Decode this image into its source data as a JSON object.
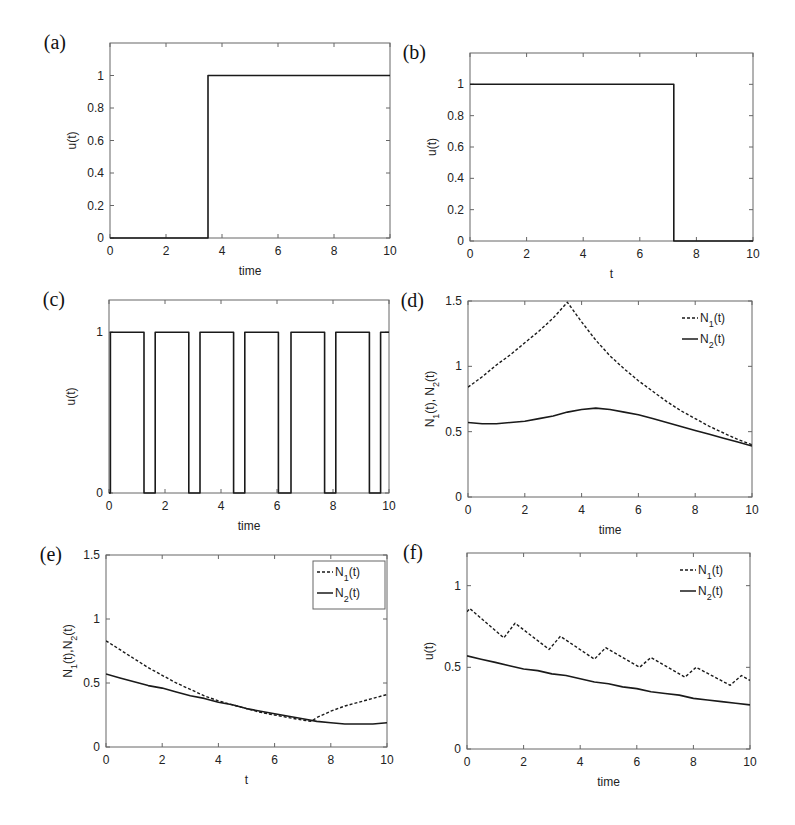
{
  "figure": {
    "caption_fragment": ""
  },
  "chart_data": [
    {
      "id": "a",
      "panel_label": "(a)",
      "type": "line",
      "xlabel": "time",
      "ylabel": "u(t)",
      "xlim": [
        0,
        10
      ],
      "ylim": [
        0,
        1.2
      ],
      "xticks": [
        0,
        2,
        4,
        6,
        8,
        10
      ],
      "yticks": [
        0,
        0.2,
        0.4,
        0.6,
        0.8,
        1
      ],
      "box": {
        "left": 110,
        "top": 43,
        "right": 390,
        "bottom": 238
      },
      "series": [
        {
          "name": "u(t)",
          "style": "solid",
          "x": [
            0,
            3.5,
            3.5,
            10
          ],
          "y": [
            0,
            0,
            1,
            1
          ]
        }
      ]
    },
    {
      "id": "b",
      "panel_label": "(b)",
      "type": "line",
      "xlabel": "t",
      "ylabel": "u(t)",
      "xlim": [
        0,
        10
      ],
      "ylim": [
        0,
        1.2
      ],
      "xticks": [
        0,
        2,
        4,
        6,
        8,
        10
      ],
      "yticks": [
        0,
        0.2,
        0.4,
        0.6,
        0.8,
        1
      ],
      "box": {
        "left": 470,
        "top": 53,
        "right": 753,
        "bottom": 241
      },
      "series": [
        {
          "name": "u(t)",
          "style": "solid",
          "x": [
            0,
            7.2,
            7.2,
            10
          ],
          "y": [
            1,
            1,
            0,
            0
          ]
        }
      ]
    },
    {
      "id": "c",
      "panel_label": "(c)",
      "type": "line",
      "xlabel": "time",
      "ylabel": "u(t)",
      "xlim": [
        0,
        10
      ],
      "ylim": [
        0,
        1.2
      ],
      "xticks": [
        0,
        2,
        4,
        6,
        8,
        10
      ],
      "yticks": [
        0,
        1
      ],
      "box": {
        "left": 109,
        "top": 300,
        "right": 389,
        "bottom": 493
      },
      "series": [
        {
          "name": "u(t)",
          "style": "solid",
          "x": [
            0,
            0.05,
            0.05,
            1.25,
            1.25,
            1.65,
            1.65,
            2.85,
            2.85,
            3.25,
            3.25,
            4.45,
            4.45,
            4.85,
            4.85,
            6.05,
            6.05,
            6.5,
            6.5,
            7.7,
            7.7,
            8.1,
            8.1,
            9.3,
            9.3,
            9.7,
            9.7,
            10
          ],
          "y": [
            0,
            0,
            1,
            1,
            0,
            0,
            1,
            1,
            0,
            0,
            1,
            1,
            0,
            0,
            1,
            1,
            0,
            0,
            1,
            1,
            0,
            0,
            1,
            1,
            0,
            0,
            1,
            1
          ]
        }
      ]
    },
    {
      "id": "d",
      "panel_label": "(d)",
      "type": "line",
      "xlabel": "time",
      "ylabel": "N1(t), N2(t)",
      "xlim": [
        0,
        10
      ],
      "ylim": [
        0,
        1.5
      ],
      "xticks": [
        0,
        2,
        4,
        6,
        8,
        10
      ],
      "yticks": [
        0,
        0.5,
        1,
        1.5
      ],
      "box": {
        "left": 468,
        "top": 301,
        "right": 752,
        "bottom": 497
      },
      "legend": {
        "position": "upper right",
        "framed": false,
        "entries": [
          "N1(t)",
          "N2(t)"
        ]
      },
      "series": [
        {
          "name": "N1(t)",
          "style": "dashed",
          "x": [
            0,
            0.5,
            1,
            1.5,
            2,
            2.5,
            3,
            3.5,
            4,
            4.5,
            5,
            5.5,
            6,
            6.5,
            7,
            7.5,
            8,
            8.5,
            9,
            9.5,
            10
          ],
          "y": [
            0.84,
            0.92,
            1.01,
            1.09,
            1.18,
            1.27,
            1.37,
            1.49,
            1.34,
            1.2,
            1.08,
            0.98,
            0.89,
            0.81,
            0.73,
            0.66,
            0.6,
            0.54,
            0.49,
            0.44,
            0.4
          ]
        },
        {
          "name": "N2(t)",
          "style": "solid",
          "x": [
            0,
            0.5,
            1,
            1.5,
            2,
            2.5,
            3,
            3.5,
            4,
            4.5,
            5,
            5.5,
            6,
            6.5,
            7,
            7.5,
            8,
            8.5,
            9,
            9.5,
            10
          ],
          "y": [
            0.57,
            0.56,
            0.56,
            0.57,
            0.58,
            0.6,
            0.62,
            0.65,
            0.67,
            0.68,
            0.67,
            0.65,
            0.63,
            0.6,
            0.57,
            0.54,
            0.51,
            0.48,
            0.45,
            0.42,
            0.39
          ]
        }
      ]
    },
    {
      "id": "e",
      "panel_label": "(e)",
      "type": "line",
      "xlabel": "t",
      "ylabel": "N1(t),N2(t)",
      "xlim": [
        0,
        10
      ],
      "ylim": [
        0,
        1.5
      ],
      "xticks": [
        0,
        2,
        4,
        6,
        8,
        10
      ],
      "yticks": [
        0,
        0.5,
        1,
        1.5
      ],
      "box": {
        "left": 106,
        "top": 555,
        "right": 387,
        "bottom": 747
      },
      "legend": {
        "position": "upper right",
        "framed": true,
        "entries": [
          "N1(t)",
          "N2(t)"
        ]
      },
      "series": [
        {
          "name": "N1(t)",
          "style": "dashed",
          "x": [
            0,
            0.5,
            1,
            1.5,
            2,
            2.5,
            3,
            3.5,
            4,
            4.5,
            5,
            5.5,
            6,
            6.5,
            7,
            7.3,
            7.5,
            8,
            8.5,
            9,
            9.5,
            10
          ],
          "y": [
            0.83,
            0.76,
            0.69,
            0.62,
            0.56,
            0.5,
            0.45,
            0.4,
            0.36,
            0.33,
            0.3,
            0.27,
            0.25,
            0.23,
            0.21,
            0.2,
            0.23,
            0.28,
            0.32,
            0.35,
            0.38,
            0.41
          ]
        },
        {
          "name": "N2(t)",
          "style": "solid",
          "x": [
            0,
            0.5,
            1,
            1.5,
            2,
            2.5,
            3,
            3.5,
            4,
            4.5,
            5,
            5.5,
            6,
            6.5,
            7,
            7.5,
            8,
            8.5,
            9,
            9.5,
            10
          ],
          "y": [
            0.57,
            0.54,
            0.51,
            0.48,
            0.46,
            0.43,
            0.4,
            0.38,
            0.35,
            0.33,
            0.3,
            0.28,
            0.26,
            0.24,
            0.22,
            0.2,
            0.19,
            0.18,
            0.18,
            0.18,
            0.19
          ]
        }
      ]
    },
    {
      "id": "f",
      "panel_label": "(f)",
      "type": "line",
      "xlabel": "time",
      "ylabel": "u(t)",
      "xlim": [
        0,
        10
      ],
      "ylim": [
        0,
        1.2
      ],
      "xticks": [
        0,
        2,
        4,
        6,
        8,
        10
      ],
      "yticks": [
        0,
        0.5,
        1
      ],
      "box": {
        "left": 467,
        "top": 553,
        "right": 750,
        "bottom": 749
      },
      "legend": {
        "position": "upper right",
        "framed": false,
        "entries": [
          "N1(t)",
          "N2(t)"
        ]
      },
      "series": [
        {
          "name": "N1(t)",
          "style": "dashed",
          "x": [
            0,
            0.1,
            1.3,
            1.7,
            2.9,
            3.3,
            4.5,
            4.9,
            6.1,
            6.5,
            7.7,
            8.1,
            9.3,
            9.7,
            10
          ],
          "y": [
            0.84,
            0.86,
            0.68,
            0.77,
            0.61,
            0.69,
            0.55,
            0.62,
            0.5,
            0.56,
            0.44,
            0.5,
            0.39,
            0.45,
            0.42
          ]
        },
        {
          "name": "N2(t)",
          "style": "solid",
          "x": [
            0,
            0.5,
            1,
            1.5,
            2,
            2.5,
            3,
            3.5,
            4,
            4.5,
            5,
            5.5,
            6,
            6.5,
            7,
            7.5,
            8,
            8.5,
            9,
            9.5,
            10
          ],
          "y": [
            0.57,
            0.55,
            0.53,
            0.51,
            0.49,
            0.48,
            0.46,
            0.45,
            0.43,
            0.41,
            0.4,
            0.38,
            0.37,
            0.35,
            0.34,
            0.33,
            0.31,
            0.3,
            0.29,
            0.28,
            0.27
          ]
        }
      ]
    }
  ]
}
